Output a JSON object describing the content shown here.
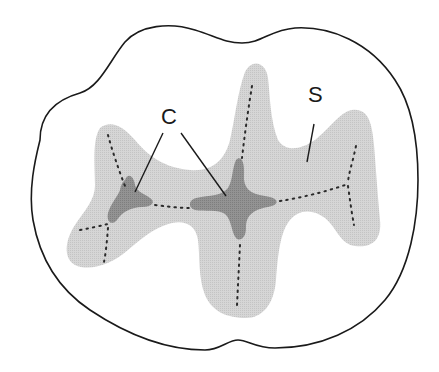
{
  "diagram": {
    "type": "dental occlusal surface illustration",
    "labels": [
      {
        "id": "C",
        "text": "C",
        "x": 161,
        "y": 106,
        "pointers": [
          [
            [
              163,
              133
            ],
            [
              135,
              192
            ]
          ],
          [
            [
              181,
              133
            ],
            [
              226,
              196
            ]
          ]
        ]
      },
      {
        "id": "S",
        "text": "S",
        "x": 308,
        "y": 84,
        "pointers": [
          [
            [
              314,
              124
            ],
            [
              307,
              162
            ]
          ]
        ]
      }
    ],
    "colors": {
      "outline": "#1a1a1a",
      "light_region": "#d4d4d4",
      "dark_region": "#8e8e8e",
      "groove_dots": "#2a2a2a",
      "label": "#1a1a1a",
      "background": "#ffffff"
    }
  }
}
